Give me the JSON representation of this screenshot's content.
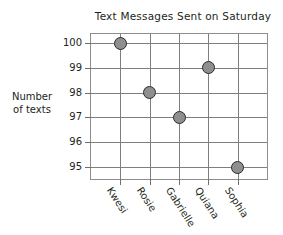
{
  "chart_data": {
    "type": "scatter",
    "title": "Text Messages Sent on Saturday",
    "xlabel": "",
    "ylabel": "Number of texts",
    "ylabel_lines": [
      "Number",
      "of texts"
    ],
    "categories": [
      "Kwesi",
      "Rosie",
      "Gabrielle",
      "Quiana",
      "Sophia"
    ],
    "values": [
      100,
      98,
      97,
      99,
      95
    ],
    "yticks": [
      100,
      99,
      98,
      97,
      96,
      95
    ],
    "ytick_labels": [
      "100",
      "99",
      "98",
      "97",
      "96",
      "95"
    ],
    "ylim": [
      95,
      100
    ],
    "grid": true,
    "legend": false,
    "marker": {
      "shape": "circle",
      "fill_color": "#8f8f8f",
      "edge_color": "#2b2b2b"
    },
    "points": [
      {
        "category": "Kwesi",
        "value": 100
      },
      {
        "category": "Rosie",
        "value": 98
      },
      {
        "category": "Gabrielle",
        "value": 97
      },
      {
        "category": "Quiana",
        "value": 99
      },
      {
        "category": "Sophia",
        "value": 95
      }
    ],
    "axis_color": "#7f7f7f",
    "background_color": "#ffffff"
  }
}
